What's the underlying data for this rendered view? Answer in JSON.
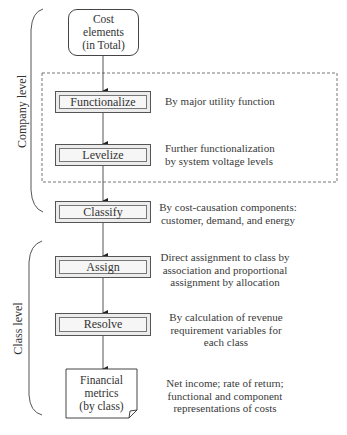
{
  "diagram": {
    "groups": [
      {
        "id": "company",
        "label": "Company level"
      },
      {
        "id": "class",
        "label": "Class level"
      }
    ],
    "start": {
      "lines": [
        "Cost",
        "elements",
        "(in Total)"
      ]
    },
    "steps": [
      {
        "label": "Functionalize",
        "description": [
          "By major utility function"
        ]
      },
      {
        "label": "Levelize",
        "description": [
          "Further functionalization",
          "by system voltage levels"
        ]
      },
      {
        "label": "Classify",
        "description": [
          "By cost-causation components:",
          "customer, demand, and energy"
        ]
      },
      {
        "label": "Assign",
        "description": [
          "Direct assignment to class by",
          "association and proportional",
          "assignment by allocation"
        ]
      },
      {
        "label": "Resolve",
        "description": [
          "By calculation of revenue",
          "requirement variables for",
          "each class"
        ]
      }
    ],
    "end": {
      "lines": [
        "Financial",
        "metrics",
        "(by class)"
      ],
      "description": [
        "Net income; rate of return;",
        "functional and component",
        "representations of costs"
      ]
    }
  }
}
